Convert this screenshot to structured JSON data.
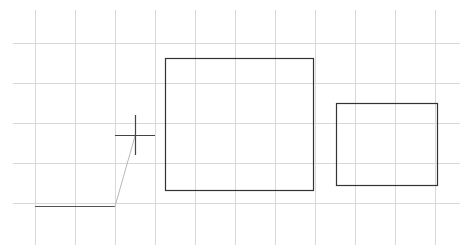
{
  "canvas": {
    "background": "#ffffff",
    "grid_color": "#d8d8d8",
    "shape_color": "#333333",
    "guide_color": "#b8b8b8"
  },
  "shapes": [
    {
      "type": "rectangle",
      "name": "large-rectangle"
    },
    {
      "type": "rectangle",
      "name": "small-rectangle"
    },
    {
      "type": "polyline",
      "name": "drawn-line"
    },
    {
      "type": "rubber-band",
      "name": "preview-segment"
    }
  ],
  "cursor": {
    "type": "crosshair"
  }
}
